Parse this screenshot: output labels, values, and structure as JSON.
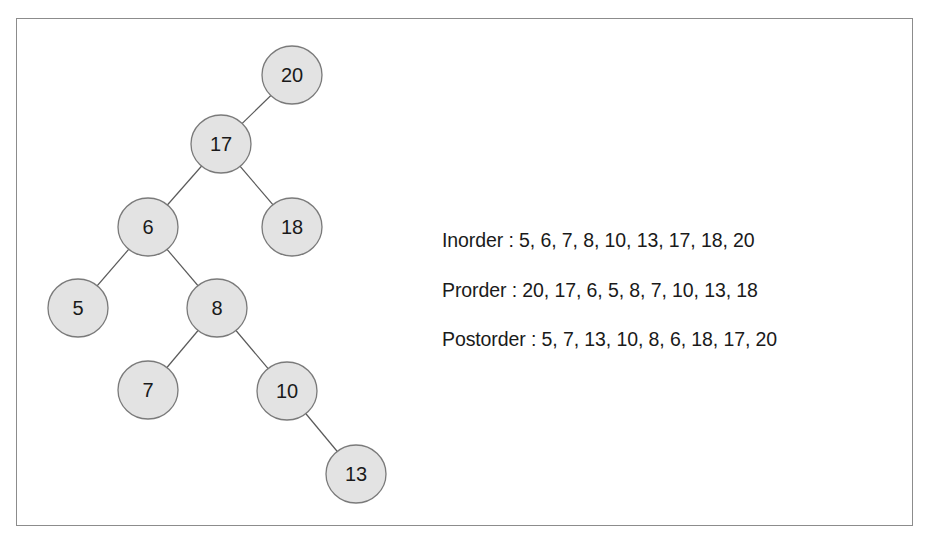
{
  "diagram": {
    "type": "binary-search-tree",
    "nodes": [
      {
        "id": "n20",
        "label": "20",
        "cx": 292,
        "cy": 75
      },
      {
        "id": "n17",
        "label": "17",
        "cx": 221,
        "cy": 144
      },
      {
        "id": "n6",
        "label": "6",
        "cx": 148,
        "cy": 227
      },
      {
        "id": "n18",
        "label": "18",
        "cx": 292,
        "cy": 227
      },
      {
        "id": "n5",
        "label": "5",
        "cx": 78,
        "cy": 308
      },
      {
        "id": "n8",
        "label": "8",
        "cx": 217,
        "cy": 308
      },
      {
        "id": "n7",
        "label": "7",
        "cx": 148,
        "cy": 390
      },
      {
        "id": "n10",
        "label": "10",
        "cx": 287,
        "cy": 391
      },
      {
        "id": "n13",
        "label": "13",
        "cx": 356,
        "cy": 474
      }
    ],
    "edges": [
      {
        "from": "n20",
        "to": "n17"
      },
      {
        "from": "n17",
        "to": "n6"
      },
      {
        "from": "n17",
        "to": "n18"
      },
      {
        "from": "n6",
        "to": "n5"
      },
      {
        "from": "n6",
        "to": "n8"
      },
      {
        "from": "n8",
        "to": "n7"
      },
      {
        "from": "n8",
        "to": "n10"
      },
      {
        "from": "n10",
        "to": "n13"
      }
    ]
  },
  "traversals": {
    "inorder": "Inorder : 5, 6, 7, 8, 10, 13, 17, 18, 20",
    "preorder": "Prorder : 20, 17, 6, 5, 8, 7, 10, 13, 18",
    "postorder": "Postorder : 5, 7, 13, 10, 8, 6, 18, 17, 20"
  },
  "colors": {
    "node_fill": "#e3e3e3",
    "node_stroke": "#7a7a7a",
    "edge": "#5a5a5a",
    "frame_border": "#8c8c8c",
    "text": "#1a1a1a"
  }
}
